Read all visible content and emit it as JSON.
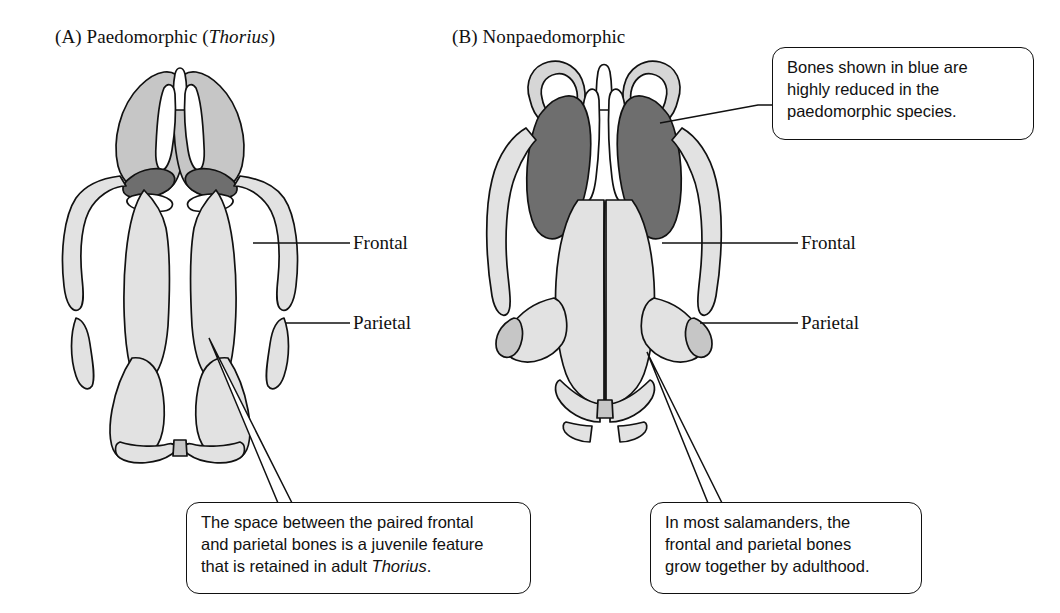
{
  "figure": {
    "type": "comparative-anatomy-diagram"
  },
  "panels": [
    {
      "id": "A",
      "tag": "(A)",
      "title_prefix": "Paedomorphic (",
      "title_italic": "Thorius",
      "title_suffix": ")",
      "labels": [
        {
          "name": "frontal",
          "text": "Frontal"
        },
        {
          "name": "parietal",
          "text": "Parietal"
        }
      ]
    },
    {
      "id": "B",
      "tag": "(B)",
      "title_prefix": "Nonpaedomorphic",
      "title_italic": "",
      "title_suffix": "",
      "labels": [
        {
          "name": "frontal",
          "text": "Frontal"
        },
        {
          "name": "parietal",
          "text": "Parietal"
        }
      ]
    }
  ],
  "callouts": {
    "blue_bones": {
      "line1": "Bones shown in blue are",
      "line2": "highly reduced in the",
      "line3": "paedomorphic species."
    },
    "juvenile_feature": {
      "line1": "The space between the paired frontal",
      "line2": "and parietal bones is a juvenile feature",
      "line3_prefix": "that is retained in adult ",
      "line3_italic": "Thorius",
      "line3_suffix": "."
    },
    "adult_fusion": {
      "line1": "In most salamanders, the",
      "line2": "frontal and parietal bones",
      "line3": "grow together by adulthood."
    }
  },
  "colors": {
    "outline": "#111111",
    "bone_light": "#e2e2e2",
    "bone_medium": "#c6c6c6",
    "bone_reduced_blue": "#6e6e6e",
    "background": "#ffffff",
    "callout_border": "#111111"
  }
}
